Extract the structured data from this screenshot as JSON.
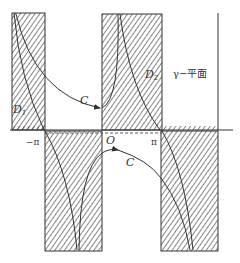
{
  "diagram": {
    "plane_label": "γ−平面",
    "curve_label_upper": "C",
    "curve_label_lower": "C",
    "region_left_label": "D",
    "region_left_sub": "1",
    "region_right_label": "D",
    "region_right_sub": "2",
    "tick_neg_pi": "−π",
    "tick_origin": "O",
    "tick_pi": "π",
    "colors": {
      "stroke": "#333333",
      "hatch": "#444444",
      "background": "#ffffff"
    }
  }
}
